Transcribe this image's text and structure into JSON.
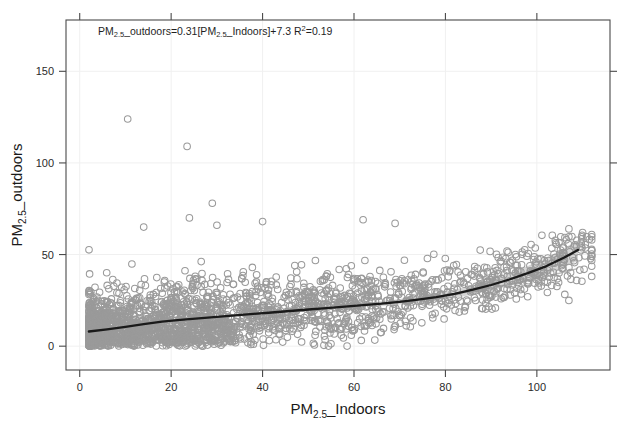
{
  "chart_data": {
    "type": "scatter",
    "title": "",
    "xlabel": "PM2.5_Indoors",
    "ylabel": "PM2.5_outdoors",
    "xlabel_parts": {
      "prefix": "PM",
      "sub": "2.5",
      "suffix": "_Indoors"
    },
    "ylabel_parts": {
      "prefix": "PM",
      "sub": "2.5",
      "suffix": "_outdoors"
    },
    "xlim": [
      -3,
      116
    ],
    "ylim": [
      -13,
      178
    ],
    "xticks": [
      0,
      20,
      40,
      60,
      80,
      100
    ],
    "yticks": [
      0,
      50,
      100,
      150
    ],
    "grid": true,
    "legend": "none",
    "annotation": {
      "text": "PM2.5_outdoors=0.31[PM2.5_Indoors]+7.3 R2=0.19",
      "slope": 0.31,
      "intercept": 7.3,
      "r_squared": 0.19,
      "x": 4,
      "y": 170
    },
    "marker": {
      "shape": "open-circle",
      "size": 6.6,
      "color": "#9a9a9a",
      "fill": "none"
    },
    "fit": {
      "type": "loess",
      "color": "#1a1a1a",
      "x": [
        2,
        6,
        10,
        14,
        18,
        22,
        26,
        30,
        34,
        38,
        42,
        46,
        50,
        54,
        58,
        62,
        66,
        70,
        74,
        78,
        82,
        86,
        90,
        94,
        98,
        102,
        106,
        109
      ],
      "y": [
        8.0,
        9.2,
        10.6,
        12.0,
        13.4,
        14.4,
        15.2,
        16.0,
        16.8,
        17.6,
        18.4,
        19.2,
        20.0,
        20.8,
        21.6,
        22.4,
        23.2,
        24.2,
        25.4,
        26.8,
        28.6,
        30.8,
        33.4,
        36.4,
        39.8,
        43.6,
        48.4,
        52.5
      ],
      "ci_upper": [
        9.4,
        10.3,
        11.5,
        12.8,
        14.1,
        15.1,
        15.9,
        16.7,
        17.5,
        18.3,
        19.1,
        19.9,
        20.8,
        21.7,
        22.6,
        23.5,
        24.5,
        25.7,
        27.1,
        28.8,
        30.9,
        33.4,
        36.4,
        39.9,
        43.8,
        48.2,
        53.6,
        58.0
      ],
      "ci_lower": [
        6.6,
        8.1,
        9.7,
        11.2,
        12.7,
        13.7,
        14.5,
        15.3,
        16.1,
        16.9,
        17.7,
        18.5,
        19.2,
        19.9,
        20.6,
        21.3,
        21.9,
        22.7,
        23.7,
        24.8,
        26.3,
        28.2,
        30.4,
        32.9,
        35.8,
        39.0,
        43.2,
        46.5
      ],
      "band_inner_upper": [
        8.8,
        9.9,
        11.2,
        12.5,
        13.8,
        14.8,
        15.6,
        16.4,
        17.2,
        18.0,
        18.8,
        19.6,
        20.4,
        21.2,
        22.0,
        22.9,
        23.7,
        24.7,
        25.9,
        27.2,
        28.8,
        30.5,
        32.3,
        34.2,
        36.2,
        38.3,
        40.9,
        42.8
      ],
      "band_inner_lower": [
        7.2,
        8.5,
        10.0,
        11.5,
        13.0,
        14.0,
        14.8,
        15.6,
        16.4,
        17.2,
        18.0,
        18.8,
        19.6,
        20.4,
        21.2,
        21.9,
        22.7,
        23.7,
        24.9,
        26.4,
        28.0,
        29.7,
        31.5,
        33.4,
        35.4,
        37.5,
        40.1,
        42.0
      ]
    },
    "n_points": 1500,
    "outliers": [
      {
        "x": 10.5,
        "y": 124
      },
      {
        "x": 23.5,
        "y": 109
      },
      {
        "x": 29,
        "y": 78
      },
      {
        "x": 14,
        "y": 65
      },
      {
        "x": 24,
        "y": 70
      },
      {
        "x": 30,
        "y": 66
      },
      {
        "x": 40,
        "y": 68
      },
      {
        "x": 62,
        "y": 69
      },
      {
        "x": 69,
        "y": 67
      },
      {
        "x": 107,
        "y": 64
      },
      {
        "x": 110,
        "y": 62
      },
      {
        "x": 98,
        "y": 27
      },
      {
        "x": 107,
        "y": 25
      }
    ]
  }
}
